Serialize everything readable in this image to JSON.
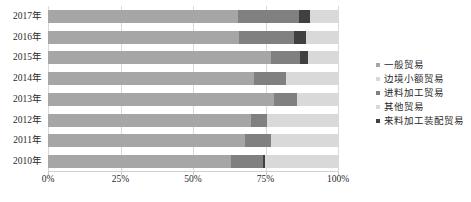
{
  "chart_data": {
    "type": "bar",
    "subtype": "stacked-horizontal-100-percent",
    "title": "",
    "xlabel": "",
    "ylabel": "",
    "xlim": [
      0,
      100
    ],
    "grid": true,
    "legend_position": "right",
    "categories": [
      "2017年",
      "2016年",
      "2015年",
      "2014年",
      "2013年",
      "2012年",
      "2011年",
      "2010年"
    ],
    "xticks": [
      "0%",
      "25%",
      "50%",
      "75%",
      "100%"
    ],
    "xtick_values": [
      0,
      25,
      50,
      75,
      100
    ],
    "series": [
      {
        "name": "一般贸易",
        "color": "#a6a6a6",
        "values": [
          65.5,
          66.0,
          77.0,
          71.0,
          78.0,
          70.0,
          68.0,
          63.0
        ]
      },
      {
        "name": "边境小额贸易",
        "color": "#d9d9d9",
        "values": [
          0.0,
          0.0,
          0.0,
          0.0,
          0.0,
          0.0,
          0.0,
          0.0
        ]
      },
      {
        "name": "进料加工贸易",
        "color": "#808080",
        "values": [
          21.0,
          19.0,
          10.0,
          11.0,
          8.0,
          5.5,
          9.0,
          11.0
        ]
      },
      {
        "name": "其他贸易",
        "color": "#d9d9d9",
        "values": [
          9.5,
          11.0,
          10.5,
          18.0,
          14.0,
          24.5,
          23.0,
          25.0
        ]
      },
      {
        "name": "来料加工装配贸易",
        "color": "#404040",
        "values": [
          4.0,
          4.0,
          2.5,
          0.0,
          0.0,
          0.0,
          0.0,
          1.0
        ]
      }
    ],
    "stack_order": [
      "一般贸易",
      "进料加工贸易",
      "来料加工装配贸易",
      "其他贸易"
    ]
  },
  "legend": {
    "items": [
      {
        "label": "一般贸易",
        "color": "#a6a6a6"
      },
      {
        "label": "边境小额贸易",
        "color": "#d9d9d9"
      },
      {
        "label": "进料加工贸易",
        "color": "#808080"
      },
      {
        "label": "其他贸易",
        "color": "#d9d9d9"
      },
      {
        "label": "来料加工装配贸易",
        "color": "#404040"
      }
    ]
  },
  "colors": {
    "gridline": "#d9d9d9",
    "axis": "#d0d0d0",
    "text": "#2a2a2a",
    "background": "#ffffff"
  }
}
